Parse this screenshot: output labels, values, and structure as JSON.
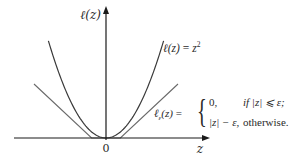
{
  "chart_data": {
    "type": "line",
    "title": "",
    "xlabel": "z",
    "ylabel": "ℓ(z)",
    "x_tick_labels": [
      "0"
    ],
    "xlim": [
      -1.0,
      1.0
    ],
    "ylim": [
      0,
      1.0
    ],
    "epsilon": 0.15,
    "grid": false,
    "series": [
      {
        "name": "squared-loss",
        "label": "ℓ(z) = z²",
        "formula": "z^2",
        "color": "#3a3a3a",
        "x": [
          -0.6,
          -0.45,
          -0.3,
          -0.15,
          0,
          0.15,
          0.3,
          0.45,
          0.6
        ],
        "y": [
          0.36,
          0.2025,
          0.09,
          0.0225,
          0,
          0.0225,
          0.09,
          0.2025,
          0.36
        ]
      },
      {
        "name": "epsilon-insensitive-loss",
        "label": "ℓε(z)",
        "formula": "0 if |z| ≤ ε; |z| − ε otherwise",
        "color": "#6a6a6a",
        "x": [
          -0.75,
          -0.15,
          0.15,
          0.75
        ],
        "y": [
          0.6,
          0,
          0,
          0.6
        ]
      }
    ]
  },
  "annotations": {
    "square_label_lhs": "ℓ(z)",
    "square_label_eq": "=",
    "square_label_rhs": "z",
    "square_label_exp": "2",
    "eps_label_lhs": "ℓ",
    "eps_label_sub": "ε",
    "eps_label_arg": "(z)",
    "eps_label_eq": "=",
    "case1_value": "0,",
    "case1_cond": "if |z| ⩽ ε;",
    "case2_value": "|z| − ε,",
    "case2_cond": "otherwise."
  },
  "axes": {
    "y_label": "ℓ(z)",
    "x_label": "z",
    "origin_label": "0"
  }
}
